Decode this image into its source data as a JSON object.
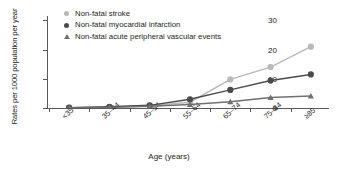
{
  "chart_data": {
    "type": "line",
    "title": "",
    "xlabel": "Age (years)",
    "ylabel": "Rates per 1000 population per year",
    "categories": [
      "<35",
      "35–44",
      "45–54",
      "55–64",
      "65–74",
      "75–84",
      "≥85"
    ],
    "yticks": [
      0,
      10,
      20,
      30
    ],
    "ylim": [
      0,
      31.5
    ],
    "grid": false,
    "legend_position": "top-left",
    "series": [
      {
        "name": "Non-fatal stroke",
        "color": "#b9b9b9",
        "marker": "circle",
        "values": [
          0.1,
          0.3,
          0.8,
          2.0,
          9.8,
          14.0,
          21.0
        ]
      },
      {
        "name": "Non-fatal myocardial infarction",
        "color": "#4b4b4d",
        "marker": "circle",
        "values": [
          0.1,
          0.4,
          0.9,
          3.0,
          6.2,
          9.4,
          11.5
        ]
      },
      {
        "name": "Non-fatal acute peripheral vascular events",
        "color": "#6f7072",
        "marker": "triangle",
        "values": [
          0.1,
          0.2,
          0.6,
          1.2,
          2.1,
          3.6,
          4.1
        ]
      }
    ]
  },
  "axis": {
    "y_title": "Rates per 1000 population per year",
    "x_title": "Age (years)",
    "y_tick_labels": [
      "0",
      "10",
      "20",
      "30"
    ],
    "x_tick_labels": [
      "<35",
      "35–44",
      "45–54",
      "55–64",
      "65–74",
      "75–84",
      "≥85"
    ]
  },
  "legend": {
    "items": [
      {
        "label": "Non-fatal stroke",
        "color": "#b9b9b9",
        "marker": "circle-marker"
      },
      {
        "label": "Non-fatal myocardial infarction",
        "color": "#4b4b4d",
        "marker": "circle-marker"
      },
      {
        "label": "Non-fatal acute peripheral vascular events",
        "color": "#6f7072",
        "marker": "triangle-marker"
      }
    ]
  },
  "colors": {
    "axis": "#58595b",
    "text": "#231f20",
    "stroke_series": "#b9b9b9",
    "mi_series": "#4b4b4d",
    "pvd_series": "#6f7072"
  }
}
